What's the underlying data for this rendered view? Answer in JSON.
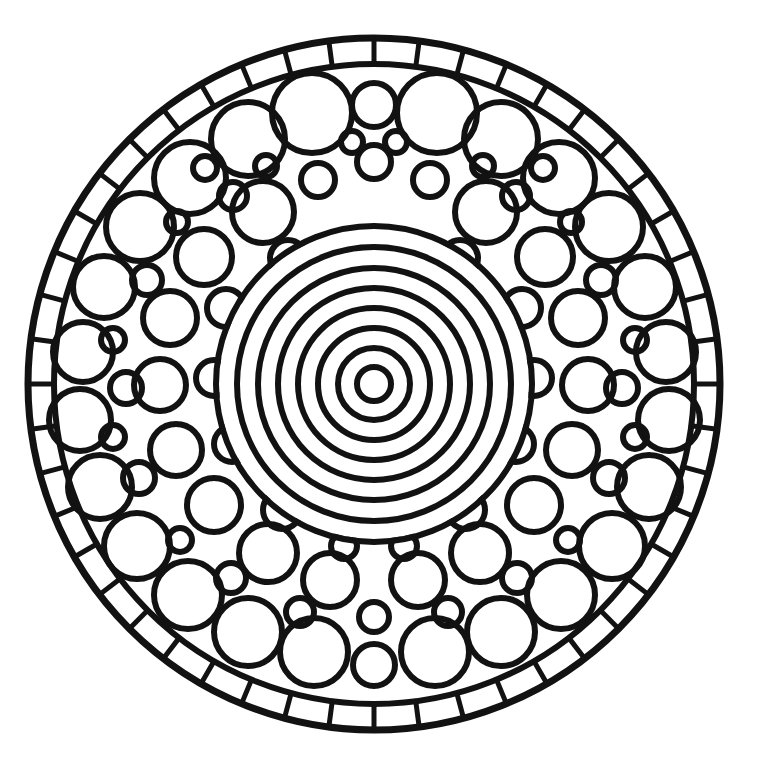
{
  "artwork": {
    "title": "Circular Mandala Coloring Page",
    "style": "black-and-white line art",
    "background_color": "#ffffff",
    "ink_color": "#121212",
    "canvas": {
      "width": 776,
      "height": 772
    },
    "center": {
      "x": 374,
      "y": 384
    },
    "outer_radius": 346
  },
  "layers": {
    "outer_border": {
      "name": "outer-border-ring",
      "radius": 346,
      "stroke_width": 7
    },
    "inner_border": {
      "name": "outer-band-inner-ring",
      "radius": 320,
      "stroke_width": 6
    },
    "band_dividers": {
      "name": "radial-band-dividers",
      "count": 48,
      "inner_radius": 320,
      "outer_radius": 346,
      "stroke_width": 5
    },
    "bullseye": {
      "name": "concentric-bullseye",
      "ring_count": 8,
      "radii": [
        158,
        137,
        116,
        96,
        76,
        56,
        36,
        17
      ],
      "stroke_width": 6
    },
    "packing": {
      "name": "circle-packed-annulus",
      "inner_radius": 163,
      "outer_radius": 318,
      "stroke_width": 6
    }
  },
  "circles": [
    {
      "x": 374,
      "y": 105,
      "r": 22
    },
    {
      "x": 312,
      "y": 113,
      "r": 40
    },
    {
      "x": 437,
      "y": 113,
      "r": 40
    },
    {
      "x": 374,
      "y": 162,
      "r": 17
    },
    {
      "x": 248,
      "y": 139,
      "r": 37
    },
    {
      "x": 501,
      "y": 139,
      "r": 37
    },
    {
      "x": 190,
      "y": 178,
      "r": 36
    },
    {
      "x": 559,
      "y": 178,
      "r": 36
    },
    {
      "x": 140,
      "y": 227,
      "r": 34
    },
    {
      "x": 609,
      "y": 227,
      "r": 34
    },
    {
      "x": 104,
      "y": 287,
      "r": 31
    },
    {
      "x": 645,
      "y": 287,
      "r": 31
    },
    {
      "x": 83,
      "y": 352,
      "r": 30
    },
    {
      "x": 666,
      "y": 352,
      "r": 30
    },
    {
      "x": 80,
      "y": 420,
      "r": 31
    },
    {
      "x": 669,
      "y": 420,
      "r": 31
    },
    {
      "x": 100,
      "y": 487,
      "r": 32
    },
    {
      "x": 649,
      "y": 487,
      "r": 32
    },
    {
      "x": 137,
      "y": 546,
      "r": 33
    },
    {
      "x": 612,
      "y": 546,
      "r": 33
    },
    {
      "x": 188,
      "y": 595,
      "r": 34
    },
    {
      "x": 561,
      "y": 595,
      "r": 34
    },
    {
      "x": 248,
      "y": 632,
      "r": 34
    },
    {
      "x": 501,
      "y": 632,
      "r": 34
    },
    {
      "x": 314,
      "y": 652,
      "r": 34
    },
    {
      "x": 435,
      "y": 652,
      "r": 34
    },
    {
      "x": 374,
      "y": 665,
      "r": 21
    },
    {
      "x": 263,
      "y": 212,
      "r": 31
    },
    {
      "x": 486,
      "y": 212,
      "r": 31
    },
    {
      "x": 204,
      "y": 257,
      "r": 28
    },
    {
      "x": 545,
      "y": 257,
      "r": 28
    },
    {
      "x": 170,
      "y": 318,
      "r": 27
    },
    {
      "x": 578,
      "y": 318,
      "r": 27
    },
    {
      "x": 160,
      "y": 385,
      "r": 26
    },
    {
      "x": 588,
      "y": 385,
      "r": 26
    },
    {
      "x": 176,
      "y": 450,
      "r": 26
    },
    {
      "x": 572,
      "y": 450,
      "r": 26
    },
    {
      "x": 214,
      "y": 505,
      "r": 27
    },
    {
      "x": 534,
      "y": 505,
      "r": 27
    },
    {
      "x": 268,
      "y": 553,
      "r": 29
    },
    {
      "x": 480,
      "y": 553,
      "r": 29
    },
    {
      "x": 330,
      "y": 580,
      "r": 27
    },
    {
      "x": 418,
      "y": 580,
      "r": 27
    },
    {
      "x": 318,
      "y": 180,
      "r": 17
    },
    {
      "x": 430,
      "y": 180,
      "r": 17
    },
    {
      "x": 233,
      "y": 196,
      "r": 14
    },
    {
      "x": 516,
      "y": 196,
      "r": 14
    },
    {
      "x": 147,
      "y": 280,
      "r": 15
    },
    {
      "x": 601,
      "y": 280,
      "r": 15
    },
    {
      "x": 126,
      "y": 388,
      "r": 16
    },
    {
      "x": 622,
      "y": 388,
      "r": 16
    },
    {
      "x": 139,
      "y": 478,
      "r": 16
    },
    {
      "x": 609,
      "y": 478,
      "r": 16
    },
    {
      "x": 231,
      "y": 578,
      "r": 15
    },
    {
      "x": 517,
      "y": 578,
      "r": 15
    },
    {
      "x": 300,
      "y": 612,
      "r": 14
    },
    {
      "x": 448,
      "y": 612,
      "r": 14
    },
    {
      "x": 374,
      "y": 617,
      "r": 15
    },
    {
      "x": 205,
      "y": 168,
      "r": 12
    },
    {
      "x": 543,
      "y": 168,
      "r": 12
    },
    {
      "x": 288,
      "y": 258,
      "r": 18
    },
    {
      "x": 460,
      "y": 258,
      "r": 18
    },
    {
      "x": 226,
      "y": 308,
      "r": 19
    },
    {
      "x": 522,
      "y": 308,
      "r": 19
    },
    {
      "x": 214,
      "y": 378,
      "r": 18
    },
    {
      "x": 534,
      "y": 378,
      "r": 18
    },
    {
      "x": 232,
      "y": 444,
      "r": 18
    },
    {
      "x": 516,
      "y": 444,
      "r": 18
    },
    {
      "x": 282,
      "y": 510,
      "r": 19
    },
    {
      "x": 466,
      "y": 510,
      "r": 19
    },
    {
      "x": 344,
      "y": 546,
      "r": 13
    },
    {
      "x": 404,
      "y": 546,
      "r": 13
    },
    {
      "x": 177,
      "y": 222,
      "r": 11
    },
    {
      "x": 571,
      "y": 222,
      "r": 11
    },
    {
      "x": 113,
      "y": 340,
      "r": 12
    },
    {
      "x": 635,
      "y": 340,
      "r": 12
    },
    {
      "x": 113,
      "y": 437,
      "r": 12
    },
    {
      "x": 635,
      "y": 437,
      "r": 12
    },
    {
      "x": 180,
      "y": 540,
      "r": 12
    },
    {
      "x": 568,
      "y": 540,
      "r": 12
    },
    {
      "x": 266,
      "y": 166,
      "r": 11
    },
    {
      "x": 483,
      "y": 166,
      "r": 11
    },
    {
      "x": 352,
      "y": 142,
      "r": 11
    },
    {
      "x": 396,
      "y": 142,
      "r": 11
    }
  ]
}
